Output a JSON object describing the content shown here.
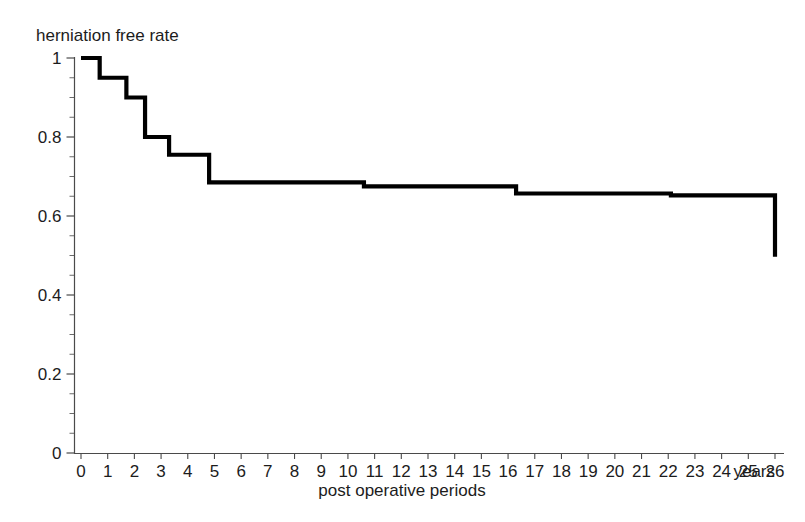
{
  "figure": {
    "y_axis_title": "herniation free rate",
    "x_axis_title": "post operative periods",
    "x_axis_unit_label": "years"
  },
  "chart_data": {
    "type": "line",
    "subtype": "kaplan-meier-step",
    "title": "",
    "ylabel": "herniation free rate",
    "xlabel": "post operative periods",
    "x_unit": "years",
    "xlim": [
      0,
      26
    ],
    "ylim": [
      0,
      1
    ],
    "grid": false,
    "legend": false,
    "x_ticks": [
      0,
      1,
      2,
      3,
      4,
      5,
      6,
      7,
      8,
      9,
      10,
      11,
      12,
      13,
      14,
      15,
      16,
      17,
      18,
      19,
      20,
      21,
      22,
      23,
      24,
      25,
      26
    ],
    "x_tick_labels": [
      "0",
      "1",
      "2",
      "3",
      "4",
      "5",
      "6",
      "7",
      "8",
      "9",
      "10",
      "11",
      "12",
      "13",
      "14",
      "15",
      "16",
      "17",
      "18",
      "19",
      "20",
      "21",
      "22",
      "23",
      "24",
      "25",
      "26"
    ],
    "y_ticks_major": [
      0,
      0.2,
      0.4,
      0.6,
      0.8,
      1
    ],
    "y_tick_labels": [
      "0",
      "0.2",
      "0.4",
      "0.6",
      "0.8",
      "1"
    ],
    "y_ticks_minor": [
      0.05,
      0.1,
      0.15,
      0.25,
      0.3,
      0.35,
      0.45,
      0.5,
      0.55,
      0.65,
      0.7,
      0.75,
      0.85,
      0.9,
      0.95
    ],
    "series": [
      {
        "name": "herniation free rate",
        "color": "#000000",
        "step": "post",
        "x": [
          0,
          0.7,
          1.7,
          2.4,
          3.3,
          4.8,
          10.6,
          16.3,
          22.1,
          26.0
        ],
        "y": [
          1.0,
          0.95,
          0.9,
          0.8,
          0.755,
          0.685,
          0.675,
          0.657,
          0.652,
          0.497
        ],
        "points": [
          {
            "x": 0.0,
            "y": 1.0
          },
          {
            "x": 0.7,
            "y": 0.95
          },
          {
            "x": 1.7,
            "y": 0.9
          },
          {
            "x": 2.4,
            "y": 0.8
          },
          {
            "x": 3.3,
            "y": 0.755
          },
          {
            "x": 4.8,
            "y": 0.685
          },
          {
            "x": 10.6,
            "y": 0.675
          },
          {
            "x": 16.3,
            "y": 0.657
          },
          {
            "x": 22.1,
            "y": 0.652
          },
          {
            "x": 26.0,
            "y": 0.497
          }
        ]
      }
    ]
  }
}
